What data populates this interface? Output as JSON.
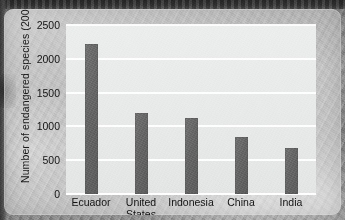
{
  "chart_data": {
    "type": "bar",
    "title": "",
    "subtitle": "",
    "xlabel": "",
    "ylabel": "Number of endangered species (2009)",
    "categories": [
      "Ecuador",
      "United States",
      "Indonesia",
      "China",
      "India"
    ],
    "category_lines": [
      [
        "Ecuador"
      ],
      [
        "United",
        "States"
      ],
      [
        "Indonesia"
      ],
      [
        "China"
      ],
      [
        "India"
      ]
    ],
    "values": [
      2215,
      1200,
      1130,
      850,
      680
    ],
    "ylim": [
      0,
      2500
    ],
    "yticks": [
      0,
      500,
      1000,
      1500,
      2000,
      2500
    ],
    "ytick_labels": [
      "0",
      "500",
      "1000",
      "1500",
      "2000",
      "2500"
    ],
    "grid": true,
    "grid_axis": "y",
    "legend": false,
    "legend_position": "none",
    "bar_color": "#666666",
    "plot_background": "#e9eaea",
    "gridline_color": "#ffffff",
    "text_color": "#141414"
  },
  "figure": {
    "panel_background": "#e4e4e4",
    "photo_background": "#8d8d8d",
    "top_band_color": "#353535"
  }
}
